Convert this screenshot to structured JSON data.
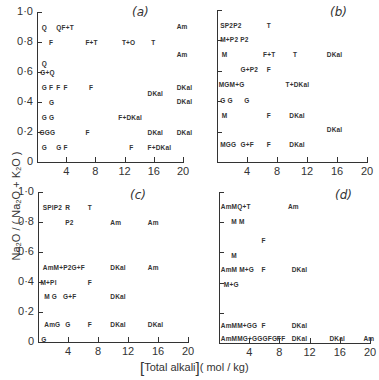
{
  "figure": {
    "y_title": "Na₂O / ( Na₂O + K₂O )",
    "x_title_main": "Total alkali",
    "x_title_unit": "( mol / kg)",
    "y_ticks": [
      "0",
      "0·2",
      "0·4",
      "0·6",
      "0·8",
      "1·0"
    ],
    "x_ticks": [
      "4",
      "8",
      "12",
      "16",
      "20"
    ]
  },
  "chart_data": [
    {
      "type": "scatter",
      "panel": "a",
      "title": "(a)",
      "xlabel": "[Total alkali] (mol/kg)",
      "ylabel": "Na2O/(Na2O+K2O)",
      "xlim": [
        0,
        20
      ],
      "ylim": [
        0,
        1.0
      ],
      "x_ticks": [
        4,
        8,
        12,
        16,
        20
      ],
      "y_ticks": [
        0,
        0.2,
        0.4,
        0.6,
        0.8,
        1.0
      ],
      "points": [
        {
          "x": 0.5,
          "y": 0.9,
          "label": "Q"
        },
        {
          "x": 2.5,
          "y": 0.9,
          "label": "QF+T"
        },
        {
          "x": 19,
          "y": 0.91,
          "label": "Am"
        },
        {
          "x": 1.5,
          "y": 0.8,
          "label": "F"
        },
        {
          "x": 6.5,
          "y": 0.8,
          "label": "F+T"
        },
        {
          "x": 11.5,
          "y": 0.8,
          "label": "T+O"
        },
        {
          "x": 15.5,
          "y": 0.8,
          "label": "T"
        },
        {
          "x": 19,
          "y": 0.72,
          "label": "Am"
        },
        {
          "x": 0.5,
          "y": 0.66,
          "label": "Q"
        },
        {
          "x": 0.3,
          "y": 0.6,
          "label": "G+Q"
        },
        {
          "x": 0.5,
          "y": 0.5,
          "label": "G"
        },
        {
          "x": 1.5,
          "y": 0.5,
          "label": "F"
        },
        {
          "x": 2.5,
          "y": 0.5,
          "label": "F"
        },
        {
          "x": 3.5,
          "y": 0.5,
          "label": "F"
        },
        {
          "x": 7,
          "y": 0.5,
          "label": "F"
        },
        {
          "x": 19,
          "y": 0.5,
          "label": "DKal"
        },
        {
          "x": 15,
          "y": 0.46,
          "label": "DKal"
        },
        {
          "x": 1.5,
          "y": 0.4,
          "label": "G"
        },
        {
          "x": 19,
          "y": 0.41,
          "label": "DKal"
        },
        {
          "x": 0.5,
          "y": 0.3,
          "label": "G"
        },
        {
          "x": 1.5,
          "y": 0.3,
          "label": "G"
        },
        {
          "x": 11,
          "y": 0.3,
          "label": "F+DKal"
        },
        {
          "x": 0.2,
          "y": 0.2,
          "label": "GGG"
        },
        {
          "x": 6.5,
          "y": 0.2,
          "label": "F"
        },
        {
          "x": 15,
          "y": 0.2,
          "label": "DKal"
        },
        {
          "x": 19,
          "y": 0.2,
          "label": "DKal"
        },
        {
          "x": 0.5,
          "y": 0.1,
          "label": "G"
        },
        {
          "x": 2.5,
          "y": 0.1,
          "label": "G"
        },
        {
          "x": 3.5,
          "y": 0.1,
          "label": "F"
        },
        {
          "x": 12.5,
          "y": 0.1,
          "label": "F"
        },
        {
          "x": 15,
          "y": 0.1,
          "label": "F+DKal"
        }
      ]
    },
    {
      "type": "scatter",
      "panel": "b",
      "title": "(b)",
      "xlim": [
        0,
        20
      ],
      "ylim": [
        0,
        1.0
      ],
      "x_ticks": [
        4,
        8,
        12,
        16,
        20
      ],
      "points": [
        {
          "x": 0.3,
          "y": 0.9,
          "label": "SP2P2"
        },
        {
          "x": 6.5,
          "y": 0.9,
          "label": "T"
        },
        {
          "x": 0.3,
          "y": 0.81,
          "label": "M+P2 P2"
        },
        {
          "x": 0.5,
          "y": 0.71,
          "label": "M"
        },
        {
          "x": 6,
          "y": 0.71,
          "label": "F+T"
        },
        {
          "x": 10,
          "y": 0.71,
          "label": "T"
        },
        {
          "x": 14.5,
          "y": 0.71,
          "label": "DKal"
        },
        {
          "x": 3,
          "y": 0.61,
          "label": "G+P2"
        },
        {
          "x": 6.5,
          "y": 0.61,
          "label": "F"
        },
        {
          "x": 0.1,
          "y": 0.51,
          "label": "MGM+G"
        },
        {
          "x": 9,
          "y": 0.51,
          "label": "T+DKal"
        },
        {
          "x": 0.3,
          "y": 0.41,
          "label": "G G"
        },
        {
          "x": 3.5,
          "y": 0.41,
          "label": "G"
        },
        {
          "x": 0.5,
          "y": 0.31,
          "label": "M"
        },
        {
          "x": 6.5,
          "y": 0.31,
          "label": "F"
        },
        {
          "x": 9.5,
          "y": 0.31,
          "label": "DKal"
        },
        {
          "x": 14.5,
          "y": 0.22,
          "label": "DKal"
        },
        {
          "x": 0.3,
          "y": 0.12,
          "label": "MGG"
        },
        {
          "x": 3,
          "y": 0.12,
          "label": "G+F"
        },
        {
          "x": 6.5,
          "y": 0.12,
          "label": "F"
        },
        {
          "x": 9.5,
          "y": 0.12,
          "label": "DKal"
        }
      ]
    },
    {
      "type": "scatter",
      "panel": "c",
      "title": "(c)",
      "xlim": [
        0,
        20
      ],
      "ylim": [
        0,
        1.0
      ],
      "x_ticks": [
        4,
        8,
        12,
        16,
        20
      ],
      "y_ticks": [
        0,
        0.2,
        0.4,
        0.6,
        0.8,
        1.0
      ],
      "points": [
        {
          "x": 0.5,
          "y": 0.9,
          "label": "SPlP2"
        },
        {
          "x": 3.5,
          "y": 0.9,
          "label": "R"
        },
        {
          "x": 6.5,
          "y": 0.9,
          "label": "T"
        },
        {
          "x": 3.5,
          "y": 0.8,
          "label": "P2"
        },
        {
          "x": 9.5,
          "y": 0.8,
          "label": "Am"
        },
        {
          "x": 14.5,
          "y": 0.8,
          "label": "Am"
        },
        {
          "x": 0.5,
          "y": 0.5,
          "label": "AmM+P2G+F"
        },
        {
          "x": 9.5,
          "y": 0.5,
          "label": "DKal"
        },
        {
          "x": 14.5,
          "y": 0.5,
          "label": "Am"
        },
        {
          "x": 0.2,
          "y": 0.4,
          "label": "M+Pl"
        },
        {
          "x": 6.5,
          "y": 0.4,
          "label": "F"
        },
        {
          "x": 0.7,
          "y": 0.31,
          "label": "M G"
        },
        {
          "x": 3.2,
          "y": 0.31,
          "label": "G+F"
        },
        {
          "x": 9.5,
          "y": 0.31,
          "label": "DKal"
        },
        {
          "x": 0.7,
          "y": 0.12,
          "label": "AmG"
        },
        {
          "x": 3.5,
          "y": 0.12,
          "label": "G"
        },
        {
          "x": 6.5,
          "y": 0.12,
          "label": "F"
        },
        {
          "x": 9.5,
          "y": 0.12,
          "label": "DKal"
        },
        {
          "x": 14.5,
          "y": 0.12,
          "label": "DKal"
        },
        {
          "x": 0.3,
          "y": 0.02,
          "label": "G"
        }
      ]
    },
    {
      "type": "scatter",
      "panel": "d",
      "title": "(d)",
      "xlim": [
        0,
        20
      ],
      "ylim": [
        0,
        1.0
      ],
      "x_ticks": [
        4,
        8,
        12,
        16,
        20
      ],
      "points": [
        {
          "x": 0.1,
          "y": 0.91,
          "label": "AmMQ+T"
        },
        {
          "x": 9,
          "y": 0.91,
          "label": "Am"
        },
        {
          "x": 1.5,
          "y": 0.81,
          "label": "M M"
        },
        {
          "x": 5.5,
          "y": 0.68,
          "label": "F"
        },
        {
          "x": 1.5,
          "y": 0.58,
          "label": "M"
        },
        {
          "x": 0.1,
          "y": 0.49,
          "label": "AmM M+G"
        },
        {
          "x": 5.5,
          "y": 0.49,
          "label": "F"
        },
        {
          "x": 9.5,
          "y": 0.49,
          "label": "DKal"
        },
        {
          "x": 0.5,
          "y": 0.39,
          "label": "M+G"
        },
        {
          "x": 0.1,
          "y": 0.12,
          "label": "AmMM+GG"
        },
        {
          "x": 5.5,
          "y": 0.12,
          "label": "F"
        },
        {
          "x": 9.5,
          "y": 0.12,
          "label": "DKal"
        },
        {
          "x": 0.1,
          "y": 0.03,
          "label": "AmMMG+GGGFG+F"
        },
        {
          "x": 7.5,
          "y": 0.03,
          "label": "F"
        },
        {
          "x": 9.5,
          "y": 0.03,
          "label": "DKal"
        },
        {
          "x": 14.5,
          "y": 0.03,
          "label": "DKal"
        },
        {
          "x": 19,
          "y": 0.03,
          "label": "Am"
        }
      ]
    }
  ]
}
